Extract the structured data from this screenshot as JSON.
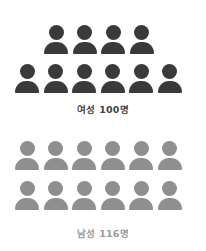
{
  "chart_data": {
    "type": "pictograph",
    "title": "",
    "series": [
      {
        "name": "여성",
        "value": 100,
        "unit": "명",
        "label": "여성 100명",
        "icons": 10,
        "color": "#3a3a3a"
      },
      {
        "name": "남성",
        "value": 116,
        "unit": "명",
        "label": "남성 116명",
        "icons": 12,
        "color": "#8f8f8f"
      }
    ]
  },
  "female": {
    "label": "여성 100명",
    "color": "#3a3a3a",
    "label_color": "#444444"
  },
  "male": {
    "label": "남성 116명",
    "color": "#8f8f8f",
    "label_color": "#9a9a9a"
  },
  "icon": "person-icon"
}
